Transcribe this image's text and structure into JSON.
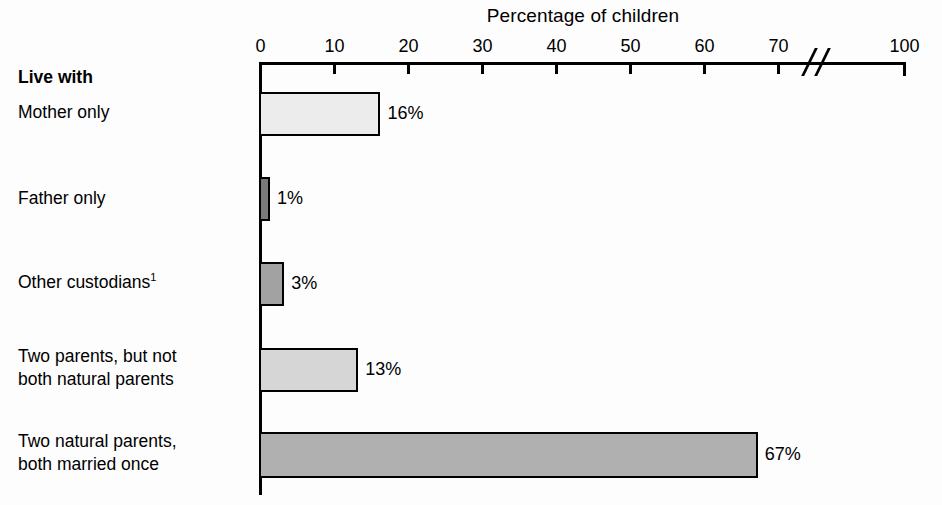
{
  "chart_data": {
    "type": "bar",
    "orientation": "horizontal",
    "title": "Percentage of children",
    "xlabel": "Percentage of children",
    "ylabel": "Live with",
    "categories": [
      "Mother only",
      "Father only",
      "Other custodians¹",
      "Two parents, but not\nboth natural parents",
      "Two natural parents,\nboth married once"
    ],
    "values": [
      16,
      1,
      3,
      13,
      67
    ],
    "value_labels": [
      "16%",
      "1%",
      "3%",
      "13%",
      "67%"
    ],
    "bar_colors": [
      "#ececec",
      "#7a7a7a",
      "#a2a2a2",
      "#d6d6d6",
      "#b0b0b0"
    ],
    "bar_border_color": "#000000",
    "xlim": [
      0,
      100
    ],
    "xticks": [
      0,
      10,
      20,
      30,
      40,
      50,
      60,
      70,
      100
    ],
    "xtick_labels": [
      "0",
      "10",
      "20",
      "30",
      "40",
      "50",
      "60",
      "70",
      "100"
    ],
    "axis_break": {
      "present": true,
      "between": [
        70,
        100
      ],
      "symbol": "//"
    },
    "grid": false,
    "legend": null
  },
  "axis_group_header": "Live with",
  "series_name": "Percentage of children"
}
